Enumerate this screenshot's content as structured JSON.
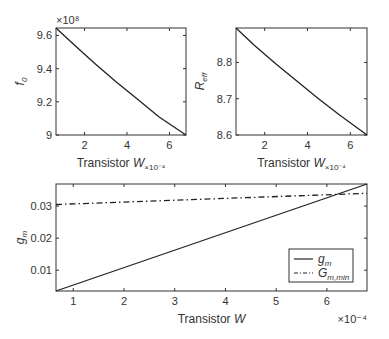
{
  "chart_data": [
    {
      "type": "line",
      "id": "f0-vs-w",
      "title": "",
      "xlabel": "Transistor W",
      "xlabel_multiplier": "×10⁻⁴",
      "ylabel": "f0",
      "ylabel_display": {
        "base": "f",
        "sub": "0"
      },
      "y_multiplier": "×10⁸",
      "xlim": [
        0.66,
        6.78
      ],
      "ylim": [
        9.0,
        9.645
      ],
      "xticks": [
        2,
        4,
        6
      ],
      "yticks": [
        9,
        9.2,
        9.4,
        9.6
      ],
      "ytick_labels": [
        "9",
        "9.2",
        "9.4",
        "9.6"
      ],
      "grid": false,
      "series": [
        {
          "name": "f0",
          "style": "solid",
          "color": "#222222",
          "x": [
            0.66,
            1.5,
            2.5,
            3.5,
            4.5,
            5.5,
            6.78
          ],
          "y": [
            9.645,
            9.545,
            9.43,
            9.32,
            9.215,
            9.11,
            9.0
          ]
        }
      ]
    },
    {
      "type": "line",
      "id": "reff-vs-w",
      "title": "",
      "xlabel": "Transistor W",
      "xlabel_multiplier": "×10⁻⁴",
      "ylabel": "Reff",
      "ylabel_display": {
        "base": "R",
        "sub": "eff"
      },
      "xlim": [
        0.66,
        6.78
      ],
      "ylim": [
        8.6,
        8.895
      ],
      "xticks": [
        2,
        4,
        6
      ],
      "yticks": [
        8.6,
        8.7,
        8.8
      ],
      "ytick_labels": [
        "8.6",
        "8.7",
        "8.8"
      ],
      "grid": false,
      "series": [
        {
          "name": "Reff",
          "style": "solid",
          "color": "#222222",
          "x": [
            0.66,
            1.5,
            2.5,
            3.5,
            4.5,
            5.5,
            6.78
          ],
          "y": [
            8.895,
            8.848,
            8.797,
            8.749,
            8.701,
            8.655,
            8.6
          ]
        }
      ]
    },
    {
      "type": "line",
      "id": "gm-vs-w",
      "title": "",
      "xlabel": "Transistor W",
      "x_multiplier": "×10⁻⁴",
      "ylabel": "gm",
      "ylabel_display": {
        "base": "g",
        "sub": "m"
      },
      "xlim": [
        0.66,
        6.79
      ],
      "ylim": [
        0.0035,
        0.0369
      ],
      "xticks": [
        1,
        2,
        3,
        4,
        5,
        6
      ],
      "yticks": [
        0.01,
        0.02,
        0.03
      ],
      "ytick_labels": [
        "0.01",
        "0.02",
        "0.03"
      ],
      "grid": false,
      "legend_position": "lower right",
      "series": [
        {
          "name": "g_m",
          "legend": {
            "base": "g",
            "sub": "m"
          },
          "style": "solid",
          "color": "#222222",
          "x": [
            0.66,
            6.79
          ],
          "y": [
            0.0035,
            0.0369
          ]
        },
        {
          "name": "G_m,min",
          "legend": {
            "base": "G",
            "sub": "m,min"
          },
          "style": "dashdot",
          "color": "#222222",
          "x": [
            0.66,
            6.79
          ],
          "y": [
            0.0305,
            0.034
          ]
        }
      ]
    }
  ]
}
